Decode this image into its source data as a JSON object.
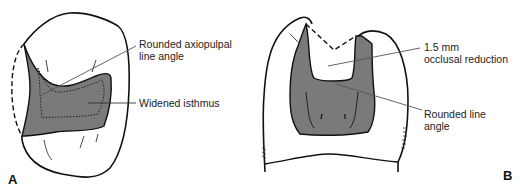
{
  "figure": {
    "colors": {
      "prep_fill": "#7a7a7a",
      "outline": "#111111",
      "leader": "#555555",
      "background": "#ffffff"
    },
    "panels": [
      {
        "id": "A",
        "letter": "A",
        "labels": [
          {
            "text": "Rounded axiopulpal line angle",
            "line1": "Rounded axiopulpal",
            "line2": "line angle"
          },
          {
            "text": "Widened isthmus",
            "line1": "Widened isthmus"
          }
        ]
      },
      {
        "id": "B",
        "letter": "B",
        "labels": [
          {
            "text": "1.5 mm occlusal reduction",
            "line1": "1.5 mm",
            "line2": "occlusal reduction"
          },
          {
            "text": "Rounded line angle",
            "line1": "Rounded line",
            "line2": "angle"
          }
        ]
      }
    ]
  }
}
